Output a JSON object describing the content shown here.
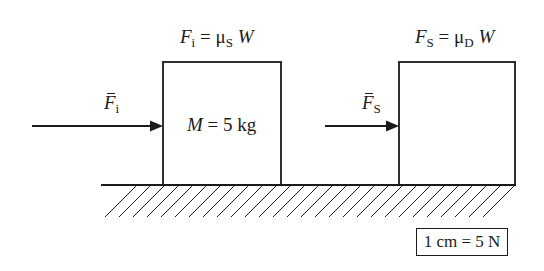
{
  "diagram": {
    "type": "free-body force diagram",
    "ground": {
      "style": "hatched surface"
    },
    "blocks": [
      {
        "id": "block-1",
        "top_label": {
          "F": "F",
          "F_sub": "i",
          "eq": "=",
          "mu": "μ",
          "mu_sub": "S",
          "W": "W"
        },
        "inner_label": {
          "M": "M",
          "rest": " = 5 kg"
        },
        "arrow_label": {
          "F": "F",
          "F_sub": "i"
        }
      },
      {
        "id": "block-2",
        "top_label": {
          "F": "F",
          "F_sub": "S",
          "eq": "=",
          "mu": "μ",
          "mu_sub": "D",
          "W": "W"
        },
        "inner_label": null,
        "arrow_label": {
          "F": "F",
          "F_sub": "S"
        }
      }
    ],
    "scale": {
      "text": "1 cm = 5 N"
    }
  },
  "colors": {
    "line": "#1a1a1a",
    "background": "#ffffff"
  }
}
